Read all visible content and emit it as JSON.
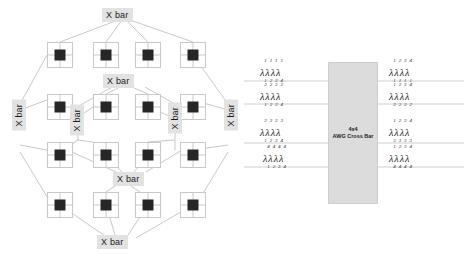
{
  "figure": {
    "left": {
      "name": "xbar-mesh-topology",
      "node_label": "switch-node",
      "grid_rows": 4,
      "grid_cols": 4,
      "xbar_labels": [
        {
          "id": "xbar-top",
          "text": "X bar",
          "orient": "horizontal",
          "x": 100,
          "y": 8
        },
        {
          "id": "xbar-upper-middle",
          "text": "X bar",
          "orient": "horizontal",
          "x": 100,
          "y": 75
        },
        {
          "id": "xbar-left",
          "text": "X bar",
          "orient": "vertical",
          "x": 12,
          "y": 100
        },
        {
          "id": "xbar-inner-left",
          "text": "X bar",
          "orient": "vertical",
          "x": 71,
          "y": 105
        },
        {
          "id": "xbar-inner-right",
          "text": "X bar",
          "orient": "vertical",
          "x": 168,
          "y": 103
        },
        {
          "id": "xbar-right",
          "text": "X bar",
          "orient": "vertical",
          "x": 224,
          "y": 100
        },
        {
          "id": "xbar-lower-middle",
          "text": "X bar",
          "orient": "horizontal",
          "x": 112,
          "y": 172
        },
        {
          "id": "xbar-bottom",
          "text": "X bar",
          "orient": "horizontal",
          "x": 95,
          "y": 235
        }
      ],
      "node_positions": [
        [
          47,
          42
        ],
        [
          93,
          42
        ],
        [
          135,
          42
        ],
        [
          180,
          42
        ],
        [
          47,
          94
        ],
        [
          93,
          94
        ],
        [
          135,
          94
        ],
        [
          180,
          94
        ],
        [
          47,
          142
        ],
        [
          93,
          142
        ],
        [
          135,
          142
        ],
        [
          180,
          142
        ],
        [
          47,
          192
        ],
        [
          93,
          192
        ],
        [
          135,
          192
        ],
        [
          180,
          192
        ]
      ]
    },
    "right": {
      "name": "awg-cross-bar",
      "box": {
        "line1": "4x4",
        "line2": "AWG Cross Bar"
      },
      "inputs": [
        {
          "row": 1,
          "items": [
            {
              "sup": "1",
              "sub": "1"
            },
            {
              "sup": "1",
              "sub": "2"
            },
            {
              "sup": "1",
              "sub": "3"
            },
            {
              "sup": "1",
              "sub": "4"
            }
          ]
        },
        {
          "row": 2,
          "items": [
            {
              "sup": "2",
              "sub": "1"
            },
            {
              "sup": "2",
              "sub": "2"
            },
            {
              "sup": "2",
              "sub": "3"
            },
            {
              "sup": "2",
              "sub": "4"
            }
          ]
        },
        {
          "row": 3,
          "items": [
            {
              "sup": "3",
              "sub": "1"
            },
            {
              "sup": "3",
              "sub": "2"
            },
            {
              "sup": "3",
              "sub": "3"
            },
            {
              "sup": "3",
              "sub": "4"
            }
          ]
        },
        {
          "row": 4,
          "items": [
            {
              "sup": "4",
              "sub": "1"
            },
            {
              "sup": "4",
              "sub": "2"
            },
            {
              "sup": "4",
              "sub": "3"
            },
            {
              "sup": "4",
              "sub": "4"
            }
          ]
        }
      ],
      "outputs": [
        {
          "row": 1,
          "items": [
            {
              "sup": "1",
              "sub": "1"
            },
            {
              "sup": "2",
              "sub": "1"
            },
            {
              "sup": "3",
              "sub": "1"
            },
            {
              "sup": "4",
              "sub": "1"
            }
          ]
        },
        {
          "row": 2,
          "items": [
            {
              "sup": "1",
              "sub": "2"
            },
            {
              "sup": "2",
              "sub": "2"
            },
            {
              "sup": "3",
              "sub": "2"
            },
            {
              "sup": "4",
              "sub": "2"
            }
          ]
        },
        {
          "row": 3,
          "items": [
            {
              "sup": "1",
              "sub": "3"
            },
            {
              "sup": "2",
              "sub": "3"
            },
            {
              "sup": "3",
              "sub": "3"
            },
            {
              "sup": "4",
              "sub": "3"
            }
          ]
        },
        {
          "row": 4,
          "items": [
            {
              "sup": "1",
              "sub": "4"
            },
            {
              "sup": "2",
              "sub": "4"
            },
            {
              "sup": "3",
              "sub": "4"
            },
            {
              "sup": "4",
              "sub": "4"
            }
          ]
        }
      ],
      "lambda_glyph": "λ",
      "waveguide_y": [
        81,
        104,
        143,
        167
      ]
    }
  },
  "colors": {
    "node_core": "#262626",
    "node_border": "#c9c9c9",
    "xbar_fill": "#e2e2e2",
    "awg_fill": "#dcdcdc",
    "link": "#b0b0b0",
    "background": "#ffffff"
  }
}
